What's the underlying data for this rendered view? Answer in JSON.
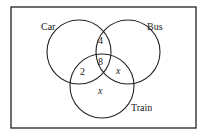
{
  "sets": [
    {
      "name": "Car",
      "cx": 79,
      "cy": 52,
      "r": 32
    },
    {
      "name": "Bus",
      "cx": 128,
      "cy": 52,
      "r": 32
    },
    {
      "name": "Train",
      "cx": 102,
      "cy": 86,
      "r": 32
    }
  ],
  "regions": {
    "car_bus": "4",
    "car_bus_train": "8",
    "car_train": "2",
    "bus_train": "x",
    "train_only": "x"
  },
  "colors": {
    "stroke": "#222222",
    "background": "#ffffff"
  }
}
